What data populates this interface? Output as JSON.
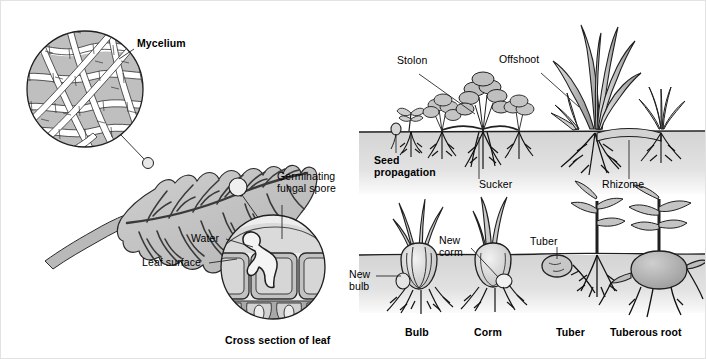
{
  "figure": {
    "background_color": "#ffffff",
    "ink_color": "#1a1a1a",
    "fill_light": "#d8d8d8",
    "fill_mid": "#bdbdbd",
    "fill_dark": "#9a9a9a",
    "soil_color": "#d9d9d9"
  },
  "left_panel": {
    "name": "fungal-infection-diagram",
    "labels": {
      "mycelium": "Mycelium",
      "germinating_spore": "Germinating\nfungal spore",
      "germinating_spore_line1": "Germinating",
      "germinating_spore_line2": "fungal spore",
      "water": "Water",
      "leaf_surface": "Leaf surface",
      "cross_section": "Cross section of leaf"
    }
  },
  "right_panel": {
    "name": "vegetative-propagation-diagram",
    "top_labels": {
      "stolon": "Stolon",
      "offshoot": "Offshoot",
      "seed_propagation_line1": "Seed",
      "seed_propagation_line2": "propagation",
      "sucker": "Sucker",
      "rhizome": "Rhizome"
    },
    "bottom_labels": {
      "new_bulb_line1": "New",
      "new_bulb_line2": "bulb",
      "new_corm_line1": "New",
      "new_corm_line2": "corm",
      "tuber_callout": "Tuber"
    },
    "captions": {
      "bulb": "Bulb",
      "corm": "Corm",
      "tuber": "Tuber",
      "tuberous_root": "Tuberous root"
    }
  }
}
